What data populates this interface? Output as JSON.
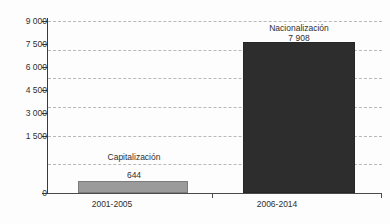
{
  "chart_data": {
    "type": "bar",
    "title": "",
    "subtitle": "",
    "xlabel": "",
    "ylabel": "",
    "categories": [
      "2001-2005",
      "2006-2014"
    ],
    "series": [
      {
        "name": "",
        "values": [
          644,
          7908
        ]
      }
    ],
    "point_labels": [
      {
        "name": "Capitalización",
        "value": 644,
        "value_text": "644"
      },
      {
        "name": "Nacionalización",
        "value": 7908,
        "value_text": "7 908"
      }
    ],
    "ylim": [
      0,
      9000
    ],
    "ytick_values": [
      0,
      1500,
      3000,
      4500,
      6000,
      7500,
      9000
    ],
    "ytick_labels": [
      "0",
      "1 500",
      "3 000",
      "4 500",
      "6 000",
      "7 500",
      "9 000"
    ],
    "grid": true,
    "grid_axis": "y",
    "grid_style": "dashed",
    "legend": false,
    "legend_position": "none",
    "colors": {
      "bar_capitalizacion": "#9b9b9b",
      "bar_nacionalizacion": "#2d2d2d",
      "gridline": "#b9b9b9",
      "axis": "#3a3a3a",
      "text": "#2f2f2f",
      "background": "#fdfdfd"
    }
  },
  "axis": {
    "y": {
      "ticks": [
        {
          "label": "9 000",
          "value": 9000
        },
        {
          "label": "7 500",
          "value": 7500
        },
        {
          "label": "6 000",
          "value": 6000
        },
        {
          "label": "4 500",
          "value": 4500
        },
        {
          "label": "3 000",
          "value": 3000
        },
        {
          "label": "1 500",
          "value": 1500
        },
        {
          "label": "0",
          "value": 0
        }
      ]
    },
    "x": {
      "ticks": [
        {
          "label": "2001-2005"
        },
        {
          "label": "2006-2014"
        }
      ]
    }
  },
  "bars": [
    {
      "name_label": "Capitalización",
      "value_label": "644",
      "category": "2001-2005"
    },
    {
      "name_label": "Nacionalización",
      "value_label": "7 908",
      "category": "2006-2014"
    }
  ]
}
